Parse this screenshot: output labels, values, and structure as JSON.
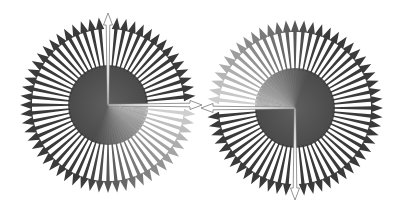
{
  "figure": {
    "background": "#ffffff",
    "arrow_color": "#3a3a3a",
    "faded_arrow_color": "#d8d8d8",
    "hand_color": "#ffffff",
    "hand_outline": "#7a7a7a",
    "disc_color": "#555555",
    "disc_faded_color": "#c4c4c4"
  },
  "dials": [
    {
      "name": "left-dial",
      "arrow_count": 60,
      "hand_long_direction": "12 o'clock",
      "hand_horizontal_direction": "3 o'clock",
      "hand_long_angle_deg": 0,
      "hand_horizontal_angle_deg": 90,
      "fade_start_deg": 90,
      "fade_span_deg": 110
    },
    {
      "name": "right-dial",
      "arrow_count": 60,
      "hand_long_direction": "6 o'clock",
      "hand_horizontal_direction": "9 o'clock",
      "hand_long_angle_deg": 180,
      "hand_horizontal_angle_deg": 270,
      "fade_start_deg": 270,
      "fade_span_deg": 110
    }
  ]
}
